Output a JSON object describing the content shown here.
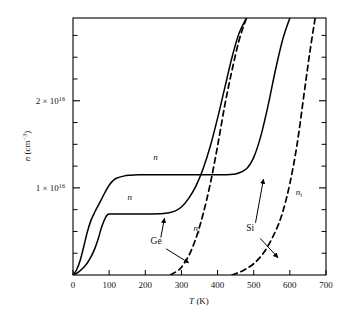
{
  "figure": {
    "background": "#ffffff",
    "line_color": "#000000",
    "axis_color": "#000000"
  },
  "chart_data": {
    "type": "line",
    "title": "",
    "subtitle": "",
    "xlabel": "T (K)",
    "ylabel": "n (cm−3)",
    "xlabel_parts": {
      "symbol": "T",
      "unit": "(K)"
    },
    "ylabel_parts": {
      "symbol": "n",
      "unit_open": "(cm",
      "unit_exp": "−3",
      "unit_close": ")"
    },
    "xlim": [
      0,
      700
    ],
    "ylim": [
      0,
      2.95e+16
    ],
    "xticks": [
      0,
      100,
      200,
      300,
      400,
      500,
      600,
      700
    ],
    "xticklabels": [
      "0",
      "100",
      "200",
      "300",
      "400",
      "500",
      "600",
      "700"
    ],
    "yticks": [
      1e+16,
      2e+16
    ],
    "yticklabels": [
      "1 × 10¹⁶",
      "2 × 10¹⁶"
    ],
    "ytick_label_parts": [
      {
        "mantissa": "1",
        "times": "×",
        "base": "10",
        "exp": "16"
      },
      {
        "mantissa": "2",
        "times": "×",
        "base": "10",
        "exp": "16"
      }
    ],
    "yminorticks": [
      2500000000000000.0,
      5000000000000000.0,
      7500000000000000.0,
      1.25e+16,
      1.5e+16,
      1.75e+16,
      2.25e+16,
      2.5e+16,
      2.75e+16
    ],
    "grid": false,
    "legend": "none",
    "series": [
      {
        "name": "Si n",
        "material": "Si",
        "quantity": "n",
        "style": "solid",
        "plateau_value": 1.15e+16,
        "points_T": [
          0,
          10,
          20,
          30,
          40,
          50,
          60,
          70,
          80,
          90,
          100,
          110,
          120,
          140,
          160,
          180,
          200,
          250,
          300,
          350,
          400,
          450,
          480,
          500,
          520,
          540,
          560,
          580,
          600
        ],
        "points_n": [
          0,
          600000000000000.0,
          1700000000000000.0,
          3300000000000000.0,
          5000000000000000.0,
          6300000000000000.0,
          7200000000000000.0,
          8000000000000000.0,
          8800000000000000.0,
          9600000000000000.0,
          1.03e+16,
          1.08e+16,
          1.11e+16,
          1.135e+16,
          1.145e+16,
          1.15e+16,
          1.15e+16,
          1.15e+16,
          1.15e+16,
          1.15e+16,
          1.15e+16,
          1.16e+16,
          1.22e+16,
          1.35e+16,
          1.6e+16,
          1.95e+16,
          2.35e+16,
          2.7e+16,
          2.95e+16
        ]
      },
      {
        "name": "Ge n",
        "material": "Ge",
        "quantity": "n",
        "style": "solid",
        "plateau_value": 7000000000000000.0,
        "points_T": [
          0,
          10,
          20,
          30,
          40,
          50,
          60,
          70,
          80,
          90,
          95,
          100,
          110,
          120,
          140,
          170,
          200,
          250,
          280,
          300,
          320,
          340,
          360,
          380,
          400,
          420,
          440,
          460,
          480
        ],
        "points_n": [
          0,
          200000000000000.0,
          500000000000000.0,
          900000000000000.0,
          1400000000000000.0,
          2100000000000000.0,
          3000000000000000.0,
          4200000000000000.0,
          5600000000000000.0,
          6600000000000000.0,
          6900000000000000.0,
          7000000000000000.0,
          7000000000000000.0,
          7000000000000000.0,
          7000000000000000.0,
          7000000000000000.0,
          7000000000000000.0,
          7050000000000000.0,
          7300000000000000.0,
          7800000000000000.0,
          8800000000000000.0,
          1.02e+16,
          1.22e+16,
          1.48e+16,
          1.8e+16,
          2.15e+16,
          2.5e+16,
          2.78e+16,
          2.95e+16
        ]
      },
      {
        "name": "Ge ni",
        "material": "Ge",
        "quantity": "ni",
        "style": "dashed",
        "points_T": [
          270,
          290,
          300,
          320,
          340,
          360,
          380,
          400,
          420,
          440,
          460,
          480
        ],
        "points_n": [
          0,
          500000000000000.0,
          900000000000000.0,
          2200000000000000.0,
          4200000000000000.0,
          7000000000000000.0,
          1.05e+16,
          1.48e+16,
          1.95e+16,
          2.35e+16,
          2.7e+16,
          2.95e+16
        ]
      },
      {
        "name": "Si ni",
        "material": "Si",
        "quantity": "ni",
        "style": "dashed",
        "points_T": [
          440,
          470,
          500,
          530,
          560,
          580,
          600,
          620,
          640,
          655,
          670
        ],
        "points_n": [
          0,
          500000000000000.0,
          1300000000000000.0,
          2700000000000000.0,
          5000000000000000.0,
          7200000000000000.0,
          1.05e+16,
          1.5e+16,
          2.1e+16,
          2.55e+16,
          2.95e+16
        ]
      }
    ],
    "annotations": [
      {
        "id": "n-si-label",
        "text": "n",
        "italic": true,
        "T": 228,
        "n": 1.32e+16
      },
      {
        "id": "n-ge-label",
        "text": "n",
        "italic": true,
        "T": 157,
        "n": 8600000000000000.0
      },
      {
        "id": "ni-ge-label",
        "text_base": "n",
        "text_sub": "i",
        "italic": true,
        "T": 342,
        "n": 5000000000000000.0
      },
      {
        "id": "ni-si-label",
        "text_base": "n",
        "text_sub": "i",
        "italic": true,
        "T": 625,
        "n": 9200000000000000.0
      },
      {
        "id": "ge-label",
        "text": "Ge",
        "italic": false,
        "T": 230,
        "n": 3600000000000000.0
      },
      {
        "id": "si-label",
        "text": "Si",
        "italic": false,
        "T": 490,
        "n": 5000000000000000.0
      }
    ],
    "arrows": [
      {
        "id": "ge-to-n-arrow",
        "from_T": 243,
        "from_n": 4300000000000000.0,
        "to_T": 253,
        "to_n": 6500000000000000.0
      },
      {
        "id": "ge-to-ni-arrow",
        "from_T": 258,
        "from_n": 3000000000000000.0,
        "to_T": 320,
        "to_n": 1400000000000000.0
      },
      {
        "id": "si-to-n-arrow",
        "from_T": 505,
        "from_n": 6000000000000000.0,
        "to_T": 527,
        "to_n": 1.1e+16
      },
      {
        "id": "si-to-ni-arrow",
        "from_T": 518,
        "from_n": 4200000000000000.0,
        "to_T": 567,
        "to_n": 2000000000000000.0
      }
    ]
  },
  "axes": {
    "frame": "box",
    "tick_direction": "in",
    "ticks_on": [
      "bottom",
      "left",
      "right"
    ]
  }
}
